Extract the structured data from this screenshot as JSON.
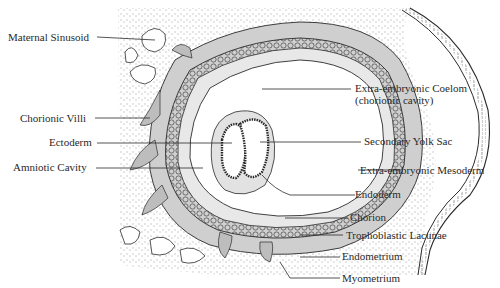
{
  "diagram": {
    "colors": {
      "ink": "#2a2a2a",
      "shade": "#c9c9c9",
      "stipple": "#8a8a8a",
      "background": "#ffffff"
    },
    "labels_left": [
      {
        "id": "maternal-sinusoid",
        "text": "Maternal Sinusoid"
      },
      {
        "id": "chorionic-villi",
        "text": "Chorionic Villi"
      },
      {
        "id": "ectoderm",
        "text": "Ectoderm"
      },
      {
        "id": "amniotic-cavity",
        "text": "Amniotic Cavity"
      }
    ],
    "labels_right": [
      {
        "id": "extra-embryonic-coelom",
        "text": "Extra-embryonic Coelom\n(chorionic cavity)"
      },
      {
        "id": "secondary-yolk-sac",
        "text": "Secondary Yolk Sac"
      },
      {
        "id": "extra-embryonic-mesoderm",
        "text": "Extra-embryonic Mesoderm"
      },
      {
        "id": "endoderm",
        "text": "Endoderm"
      },
      {
        "id": "chorion",
        "text": "Chorion"
      },
      {
        "id": "trophoblastic-lacunae",
        "text": "Trophoblastic Lacunae"
      },
      {
        "id": "endometrium",
        "text": "Endometrium"
      },
      {
        "id": "myometrium",
        "text": "Myometrium"
      }
    ]
  }
}
